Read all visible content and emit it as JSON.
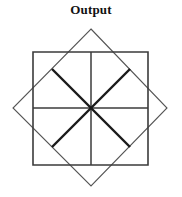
{
  "figure": {
    "title": "Output",
    "background_color": "#ffffff",
    "width": 182,
    "height": 197
  },
  "chart_data": {
    "type": "diagram",
    "title": "Output",
    "subtitle": "",
    "xlabel": "",
    "ylabel": "",
    "grid": false,
    "legend": "none",
    "center": {
      "x": 91,
      "y": 108
    },
    "shapes": [
      {
        "name": "outer-square",
        "kind": "square",
        "rotation_deg": 0,
        "stroke": "#3b3b3b",
        "stroke_width": 1.6,
        "fill": "none",
        "points": [
          {
            "x": 33,
            "y": 52
          },
          {
            "x": 148,
            "y": 52
          },
          {
            "x": 148,
            "y": 165
          },
          {
            "x": 33,
            "y": 165
          }
        ]
      },
      {
        "name": "rotated-square",
        "kind": "square",
        "rotation_deg": 45,
        "stroke": "#555555",
        "stroke_width": 1.1,
        "fill": "none",
        "points": [
          {
            "x": 91,
            "y": 29
          },
          {
            "x": 167,
            "y": 108
          },
          {
            "x": 91,
            "y": 186
          },
          {
            "x": 13,
            "y": 108
          }
        ]
      }
    ],
    "rays": [
      {
        "name": "ray-up",
        "angle_deg": 90,
        "stroke": "#3b3b3b",
        "stroke_width": 1.5,
        "x1": 91,
        "y1": 108,
        "x2": 91,
        "y2": 52
      },
      {
        "name": "ray-down",
        "angle_deg": 270,
        "stroke": "#3b3b3b",
        "stroke_width": 1.5,
        "x1": 91,
        "y1": 108,
        "x2": 91,
        "y2": 165
      },
      {
        "name": "ray-left",
        "angle_deg": 180,
        "stroke": "#3b3b3b",
        "stroke_width": 1.5,
        "x1": 91,
        "y1": 108,
        "x2": 33,
        "y2": 108
      },
      {
        "name": "ray-right",
        "angle_deg": 0,
        "stroke": "#3b3b3b",
        "stroke_width": 1.5,
        "x1": 91,
        "y1": 108,
        "x2": 148,
        "y2": 108
      },
      {
        "name": "ray-up-left",
        "angle_deg": 135,
        "stroke": "#1a1a1a",
        "stroke_width": 2.4,
        "x1": 91,
        "y1": 108,
        "x2": 52,
        "y2": 69
      },
      {
        "name": "ray-up-right",
        "angle_deg": 45,
        "stroke": "#1a1a1a",
        "stroke_width": 2.4,
        "x1": 91,
        "y1": 108,
        "x2": 130,
        "y2": 69
      },
      {
        "name": "ray-down-left",
        "angle_deg": 225,
        "stroke": "#1a1a1a",
        "stroke_width": 2.4,
        "x1": 91,
        "y1": 108,
        "x2": 52,
        "y2": 147
      },
      {
        "name": "ray-down-right",
        "angle_deg": 315,
        "stroke": "#1a1a1a",
        "stroke_width": 2.4,
        "x1": 91,
        "y1": 108,
        "x2": 130,
        "y2": 147
      }
    ]
  }
}
